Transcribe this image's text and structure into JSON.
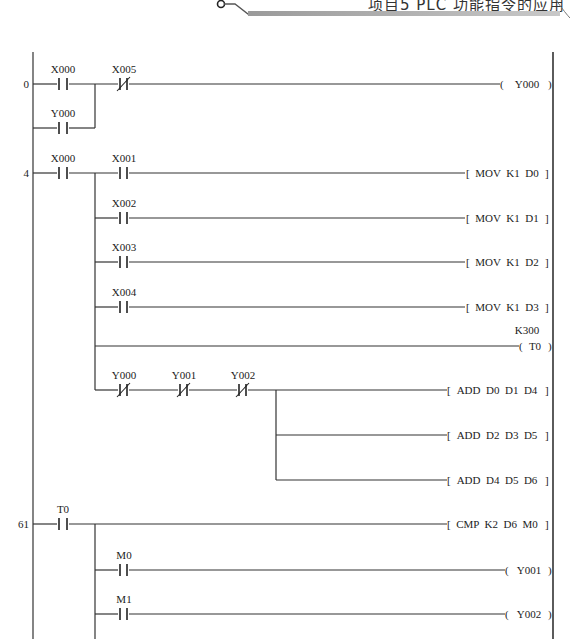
{
  "header": {
    "title": "项目5  PLC 功能指令的应用",
    "bar_color": "#b0b0b0"
  },
  "rungs": [
    {
      "step": "0",
      "contacts": [
        {
          "name": "X000",
          "type": "NO"
        },
        {
          "name": "X005",
          "type": "NC"
        }
      ],
      "parallel": [
        {
          "name": "Y000",
          "type": "NO"
        }
      ],
      "outputs": [
        {
          "kind": "coil",
          "text": "Y000"
        }
      ]
    },
    {
      "step": "4",
      "contacts": [
        {
          "name": "X000",
          "type": "NO"
        }
      ],
      "branches": [
        {
          "contacts": [
            {
              "name": "X001",
              "type": "NO"
            }
          ],
          "output": "MOV  K1  D0"
        },
        {
          "contacts": [
            {
              "name": "X002",
              "type": "NO"
            }
          ],
          "output": "MOV  K1  D1"
        },
        {
          "contacts": [
            {
              "name": "X003",
              "type": "NO"
            }
          ],
          "output": "MOV  K1  D2"
        },
        {
          "contacts": [
            {
              "name": "X004",
              "type": "NO"
            }
          ],
          "output": "MOV  K1  D3"
        },
        {
          "contacts": [],
          "coil": "T0",
          "preset": "K300"
        },
        {
          "contacts": [
            {
              "name": "Y000",
              "type": "NC"
            },
            {
              "name": "Y001",
              "type": "NC"
            },
            {
              "name": "Y002",
              "type": "NC"
            }
          ],
          "outputs": [
            "ADD  D0  D1  D4",
            "ADD  D2  D3  D5",
            "ADD  D4  D5  D6"
          ]
        }
      ]
    },
    {
      "step": "61",
      "contacts": [
        {
          "name": "T0",
          "type": "NO"
        }
      ],
      "branches": [
        {
          "contacts": [],
          "output": "CMP  K2  D6  M0"
        },
        {
          "contacts": [
            {
              "name": "M0",
              "type": "NO"
            }
          ],
          "coil": "Y001"
        },
        {
          "contacts": [
            {
              "name": "M1",
              "type": "NO"
            }
          ],
          "coil": "Y002"
        }
      ]
    }
  ],
  "labels": {
    "s0": "0",
    "s4": "4",
    "s61": "61",
    "x000a": "X000",
    "x005": "X005",
    "y000p": "Y000",
    "coil_y000": "Y000",
    "x000b": "X000",
    "x001": "X001",
    "x002": "X002",
    "x003": "X003",
    "x004": "X004",
    "mov0": "MOV  K1  D0",
    "mov1": "MOV  K1  D1",
    "mov2": "MOV  K1  D2",
    "mov3": "MOV  K1  D3",
    "k300": "K300",
    "coil_t0": "T0",
    "y000n": "Y000",
    "y001n": "Y001",
    "y002n": "Y002",
    "add1": "ADD  D0  D1  D4",
    "add2": "ADD  D2  D3  D5",
    "add3": "ADD  D4  D5  D6",
    "t0": "T0",
    "cmp": "CMP  K2  D6  M0",
    "m0": "M0",
    "m1": "M1",
    "coil_y001": "Y001",
    "coil_y002": "Y002"
  }
}
